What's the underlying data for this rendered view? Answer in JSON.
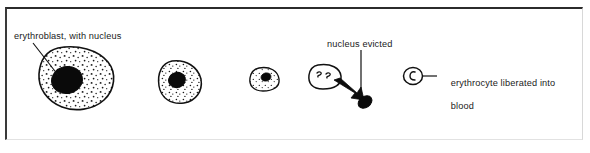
{
  "figure": {
    "width": 590,
    "height": 153,
    "background_color": "#ffffff",
    "ink_color": "#111111",
    "border_color": "#2b2b2b"
  },
  "labels": {
    "erythroblast": "erythroblast, with nucleus",
    "nucleus_evicted": "nucleus evicted",
    "erythrocyte_line1": "erythrocyte liberated into",
    "erythrocyte_line2": "blood"
  },
  "stages": [
    {
      "name": "stage-1-erythroblast",
      "description": "large stippled cell with big dark nucleus",
      "cx": 75,
      "cy": 78,
      "rx": 36,
      "ry": 30,
      "nucleus": {
        "cx": 67,
        "cy": 80,
        "rx": 15,
        "ry": 13
      },
      "stippled": true
    },
    {
      "name": "stage-2-erythroblast",
      "description": "smaller stippled cell with dark nucleus",
      "cx": 180,
      "cy": 80,
      "rx": 21,
      "ry": 19,
      "nucleus": {
        "cx": 176,
        "cy": 80,
        "rx": 8,
        "ry": 7.5
      },
      "stippled": true
    },
    {
      "name": "stage-3-normoblast",
      "description": "small stippled cell with small nucleus",
      "cx": 265,
      "cy": 79,
      "rx": 15,
      "ry": 11,
      "nucleus": {
        "cx": 265,
        "cy": 77,
        "rx": 5,
        "ry": 4
      },
      "stippled": true
    },
    {
      "name": "stage-4-nucleus-extrusion",
      "description": "cell expelling its nucleus, arrow to ejected nucleus",
      "cx": 325,
      "cy": 76,
      "rx": 15,
      "ry": 11,
      "ejected_nucleus": {
        "cx": 364,
        "cy": 101,
        "rx": 7,
        "ry": 5
      },
      "stippled": false
    },
    {
      "name": "stage-5-erythrocyte",
      "description": "mature erythrocyte, small circle",
      "cx": 413,
      "cy": 76,
      "r": 9,
      "stippled": false
    }
  ],
  "leaders": [
    {
      "name": "leader-erythroblast",
      "from": [
        33,
        43
      ],
      "to": [
        57,
        74
      ]
    },
    {
      "name": "leader-nucleus-evicted",
      "from": [
        361,
        50
      ],
      "to": [
        361,
        96
      ]
    },
    {
      "name": "leader-erythrocyte",
      "from": [
        423,
        76
      ],
      "to": [
        437,
        76
      ]
    }
  ]
}
